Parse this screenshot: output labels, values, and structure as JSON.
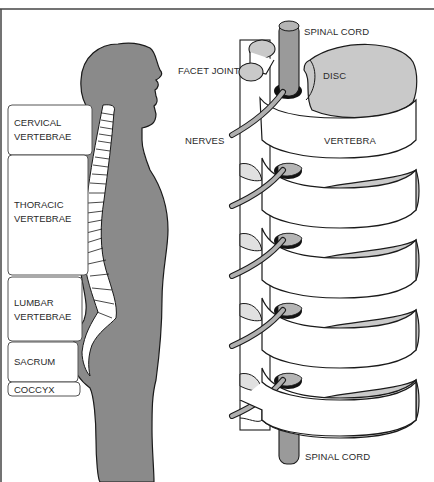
{
  "figure": {
    "type": "anatomical-diagram",
    "left_panel": {
      "description": "side-view human silhouette with spinal column",
      "regions": [
        {
          "label_line1": "CERVICAL",
          "label_line2": "VERTEBRAE"
        },
        {
          "label_line1": "THORACIC",
          "label_line2": "VERTEBRAE"
        },
        {
          "label_line1": "LUMBAR",
          "label_line2": "VERTEBRAE"
        },
        {
          "label_line1": "SACRUM",
          "label_line2": ""
        },
        {
          "label_line1": "COCCYX",
          "label_line2": ""
        }
      ]
    },
    "right_panel": {
      "description": "close-up of stacked vertebrae with discs and nerves",
      "labels": {
        "spinal_cord_top": "SPINAL CORD",
        "facet_joint": "FACET JOINT",
        "disc": "DISC",
        "nerves": "NERVES",
        "vertebra": "VERTEBRA",
        "spinal_cord_bottom": "SPINAL CORD"
      }
    },
    "colors": {
      "body_fill": "#8a8a8a",
      "disc_fill": "#c9c9c9",
      "cord_fill": "#9a9a9a",
      "outline": "#1a1a1a",
      "background": "#ffffff",
      "frame": "#444444"
    }
  }
}
